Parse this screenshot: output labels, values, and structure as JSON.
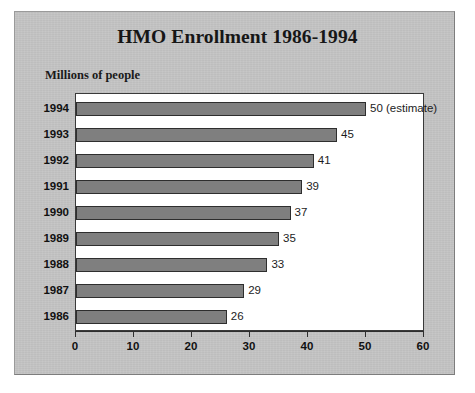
{
  "chart_data": {
    "type": "bar",
    "orientation": "horizontal",
    "title": "HMO Enrollment 1986-1994",
    "ylabel_note": "Millions of people",
    "xlabel": "",
    "ylabel": "",
    "xlim": [
      0,
      60
    ],
    "xticks": [
      0,
      10,
      20,
      30,
      40,
      50,
      60
    ],
    "xtick_labels": [
      "0",
      "10",
      "20",
      "30",
      "40",
      "50",
      "60"
    ],
    "grid": false,
    "legend": false,
    "categories": [
      "1994",
      "1993",
      "1992",
      "1991",
      "1990",
      "1989",
      "1988",
      "1987",
      "1986"
    ],
    "values": [
      50,
      45,
      41,
      39,
      37,
      35,
      33,
      29,
      26
    ],
    "data_labels": [
      "50 (estimate)",
      "45",
      "41",
      "39",
      "37",
      "35",
      "33",
      "29",
      "26"
    ],
    "annotations": [
      "1994 value is an estimate"
    ],
    "colors": {
      "bar_fill": "#7f7f7f",
      "bar_border": "#2e2e2e",
      "panel_background": "#c4c4c4",
      "plot_background": "#ffffff",
      "text": "#111111"
    }
  }
}
